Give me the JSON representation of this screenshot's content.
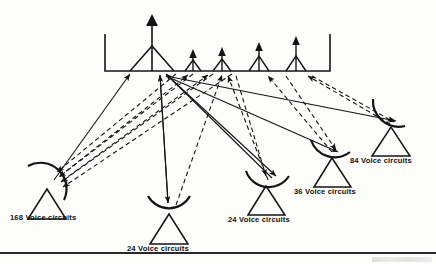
{
  "figure": {
    "satellite": {
      "name": "satellite-payload",
      "large_antenna_count": 1,
      "small_antenna_count": 4,
      "platform_left": 105,
      "platform_right": 330,
      "platform_top": 34,
      "platform_bottom": 71
    },
    "link_styles": {
      "uplink": "solid",
      "downlink": "dashed",
      "line_color": "#141414"
    },
    "ground_stations": [
      {
        "id": "station-168",
        "label": "168 Voice circuits",
        "capacity": 168,
        "units": "Voice circuits",
        "label_x": 10,
        "label_y": 214,
        "dish_x": 47,
        "dish_y": 186,
        "dish_rotation": -38
      },
      {
        "id": "station-24-left",
        "label": "24 Voice circuits",
        "capacity": 24,
        "units": "Voice circuits",
        "label_x": 127,
        "label_y": 245,
        "dish_x": 168,
        "dish_y": 212,
        "dish_rotation": 0
      },
      {
        "id": "station-24-right",
        "label": "24 Voice circuits",
        "capacity": 24,
        "units": "Voice circuits",
        "label_x": 228,
        "label_y": 216,
        "dish_x": 265,
        "dish_y": 184,
        "dish_rotation": -14
      },
      {
        "id": "station-36",
        "label": "36 Voice circuits",
        "capacity": 36,
        "units": "Voice circuits",
        "label_x": 294,
        "label_y": 188,
        "dish_x": 331,
        "dish_y": 157,
        "dish_rotation": -30
      },
      {
        "id": "station-84",
        "label": "84 Voice circuits",
        "capacity": 84,
        "units": "Voice circuits",
        "label_x": 350,
        "label_y": 157,
        "dish_x": 390,
        "dish_y": 126,
        "dish_rotation": -42
      }
    ]
  }
}
